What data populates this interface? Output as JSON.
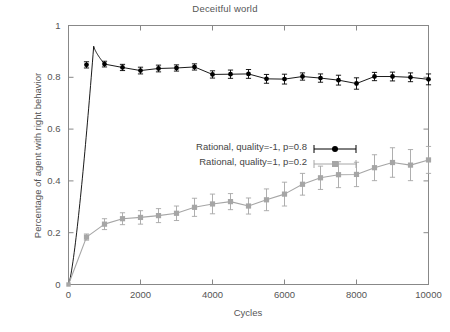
{
  "chart_data": {
    "type": "line",
    "title": "Deceitful world",
    "xlabel": "Cycles",
    "ylabel": "Percentage of agent with right behavior",
    "xlim": [
      0,
      10000
    ],
    "ylim": [
      0,
      1
    ],
    "xticks": [
      0,
      2000,
      4000,
      6000,
      8000,
      10000
    ],
    "xtick_labels": [
      "0",
      "2000",
      "4000",
      "6000",
      "8000",
      "10000"
    ],
    "yticks": [
      0,
      0.2,
      0.4,
      0.6,
      0.8,
      1
    ],
    "ytick_labels": [
      "0",
      "0.2",
      "0.4",
      "0.6",
      "0.8",
      "1"
    ],
    "grid": false,
    "legend_position": "center",
    "series": [
      {
        "name": "Rational, quality=-1, p=0.8",
        "color": "#000000",
        "marker": "circle",
        "x": [
          0,
          500,
          1000,
          1500,
          2000,
          2500,
          3000,
          3500,
          4000,
          4500,
          5000,
          5500,
          6000,
          6500,
          7000,
          7500,
          8000,
          8500,
          9000,
          9500,
          10000
        ],
        "values": [
          0.0,
          0.848,
          0.851,
          0.838,
          0.826,
          0.834,
          0.836,
          0.84,
          0.811,
          0.812,
          0.813,
          0.794,
          0.793,
          0.803,
          0.797,
          0.789,
          0.776,
          0.803,
          0.803,
          0.8,
          0.792
        ],
        "errors": [
          0.0,
          0.012,
          0.011,
          0.012,
          0.013,
          0.013,
          0.012,
          0.012,
          0.014,
          0.016,
          0.017,
          0.017,
          0.019,
          0.014,
          0.016,
          0.019,
          0.022,
          0.016,
          0.017,
          0.017,
          0.021
        ],
        "peak_x": 700,
        "peak_value": 0.92
      },
      {
        "name": "Rational, quality=1, p=0.2",
        "color": "#a6a6a6",
        "marker": "square",
        "x": [
          0,
          500,
          1000,
          1500,
          2000,
          2500,
          3000,
          3500,
          4000,
          4500,
          5000,
          5500,
          6000,
          6500,
          7000,
          7500,
          8000,
          8500,
          9000,
          9500,
          10000
        ],
        "values": [
          0.0,
          0.183,
          0.233,
          0.254,
          0.259,
          0.266,
          0.275,
          0.298,
          0.311,
          0.32,
          0.303,
          0.327,
          0.349,
          0.387,
          0.412,
          0.424,
          0.425,
          0.451,
          0.471,
          0.461,
          0.481
        ],
        "errors": [
          0.0,
          0.012,
          0.021,
          0.023,
          0.026,
          0.027,
          0.028,
          0.035,
          0.038,
          0.031,
          0.031,
          0.042,
          0.046,
          0.042,
          0.045,
          0.05,
          0.047,
          0.05,
          0.057,
          0.06,
          0.052
        ]
      }
    ]
  },
  "legend": {
    "entries": [
      {
        "label": "Rational, quality=-1, p=0.8"
      },
      {
        "label": "Rational, quality=1, p=0.2"
      }
    ]
  }
}
